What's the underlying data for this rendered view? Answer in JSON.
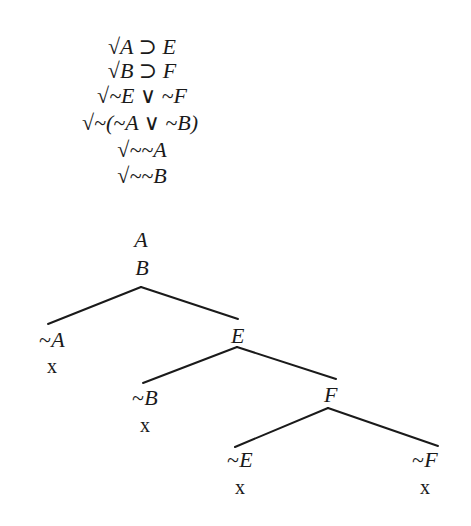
{
  "trunk": {
    "lines": [
      {
        "text": "√A ⊃ E",
        "checked": true,
        "x": 142,
        "y": 47
      },
      {
        "text": "√B ⊃ F",
        "checked": true,
        "x": 142,
        "y": 71
      },
      {
        "text": "√~E ∨ ~F",
        "checked": true,
        "x": 142,
        "y": 96
      },
      {
        "text": "√~(~A ∨ ~B)",
        "checked": true,
        "x": 140,
        "y": 123
      },
      {
        "text": "√~~A",
        "checked": true,
        "x": 142,
        "y": 150
      },
      {
        "text": "√~~B",
        "checked": true,
        "x": 142,
        "y": 176
      },
      {
        "text": "A",
        "checked": false,
        "x": 141,
        "y": 240
      },
      {
        "text": "B",
        "checked": false,
        "x": 142,
        "y": 268
      }
    ]
  },
  "nodes": [
    {
      "id": "notA",
      "text": "~A",
      "x": 52,
      "y": 340,
      "closed": true,
      "close_mark": "x",
      "close_y": 366
    },
    {
      "id": "E",
      "text": "E",
      "x": 238,
      "y": 336,
      "closed": false
    },
    {
      "id": "notB",
      "text": "~B",
      "x": 145,
      "y": 398,
      "closed": true,
      "close_mark": "x",
      "close_y": 425
    },
    {
      "id": "F",
      "text": "F",
      "x": 331,
      "y": 395,
      "closed": false
    },
    {
      "id": "notE",
      "text": "~E",
      "x": 240,
      "y": 460,
      "closed": true,
      "close_mark": "x",
      "close_y": 487
    },
    {
      "id": "notF",
      "text": "~F",
      "x": 425,
      "y": 460,
      "closed": true,
      "close_mark": "x",
      "close_y": 487
    }
  ],
  "branches": [
    {
      "from": [
        141,
        287
      ],
      "to": [
        48,
        324
      ]
    },
    {
      "from": [
        141,
        287
      ],
      "to": [
        238,
        319
      ]
    },
    {
      "from": [
        237,
        347
      ],
      "to": [
        143,
        383
      ]
    },
    {
      "from": [
        237,
        347
      ],
      "to": [
        336,
        379
      ]
    },
    {
      "from": [
        328,
        408
      ],
      "to": [
        235,
        447
      ]
    },
    {
      "from": [
        328,
        408
      ],
      "to": [
        438,
        446
      ]
    }
  ],
  "colors": {
    "ink": "#1a1a1a",
    "background": "#ffffff"
  }
}
